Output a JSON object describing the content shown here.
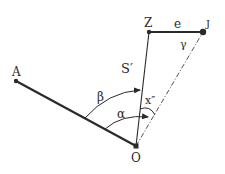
{
  "diagram": {
    "type": "geometry-angle-diagram",
    "colors": {
      "ink": "#2a2a2a",
      "dashed": "#555555",
      "background": "#ffffff"
    },
    "points": [
      {
        "id": "A",
        "label": "A",
        "x": 16,
        "y": 81
      },
      {
        "id": "O",
        "label": "O",
        "x": 136,
        "y": 146
      },
      {
        "id": "Z",
        "label": "Z",
        "x": 149,
        "y": 32
      },
      {
        "id": "J",
        "label": "J",
        "x": 203,
        "y": 32
      }
    ],
    "segments": [
      {
        "from": "A",
        "to": "O",
        "style": "thick"
      },
      {
        "from": "O",
        "to": "Z",
        "style": "thin",
        "label": "S′"
      },
      {
        "from": "Z",
        "to": "J",
        "style": "thick",
        "label": "e"
      },
      {
        "from": "O",
        "to": "J",
        "style": "dash-dot"
      }
    ],
    "angles": [
      {
        "label": "β",
        "vertex": "O",
        "from": "A",
        "to": "Z"
      },
      {
        "label": "α",
        "vertex": "O",
        "from": "A",
        "to": "J"
      },
      {
        "label": "x″",
        "vertex": "O",
        "from": "Z",
        "to": "J"
      },
      {
        "label": "γ",
        "vertex": "J",
        "from": "Z",
        "to": "O"
      }
    ],
    "labels": {
      "A": "A",
      "O": "O",
      "Z": "Z",
      "J": "J",
      "e": "e",
      "S": "S′",
      "beta": "β",
      "alpha": "α",
      "x": "x″",
      "gamma": "γ"
    }
  }
}
